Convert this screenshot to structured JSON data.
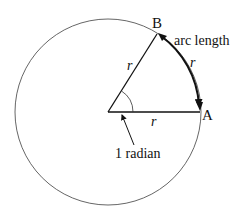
{
  "labels": {
    "point_a": "A",
    "point_b": "B",
    "arc_length": "arc length",
    "radius_ob": "r",
    "radius_oa": "r",
    "arc_r": "r",
    "angle": "1 radian"
  },
  "geometry": {
    "center": [
      108,
      112
    ],
    "radius": 93,
    "angle_rad": 1
  },
  "colors": {
    "circle": "#555555",
    "lines": "#111111",
    "background": "#ffffff"
  }
}
